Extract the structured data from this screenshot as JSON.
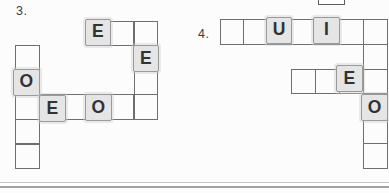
{
  "colors": {
    "bg": "#fcfcfc",
    "grid-line": "#6f6f6f",
    "tile-bg": "#e5e5e5",
    "tile-border": "#9a9a9a",
    "letter": "#323232",
    "label": "#3c3c3c",
    "divider-top": "#c6c6c6",
    "divider-bottom": "#a2a2a2"
  },
  "puzzles": [
    {
      "number": "3.",
      "label_pos": {
        "x": 16,
        "y": 4
      },
      "grid": {
        "x": 15,
        "y": 20.5,
        "cell_w": 23.7,
        "cell_h": 24.6
      },
      "cells": [
        [
          3,
          0
        ],
        [
          4,
          0
        ],
        [
          5,
          0
        ],
        [
          0,
          1
        ],
        [
          5,
          1
        ],
        [
          0,
          2
        ],
        [
          5,
          2
        ],
        [
          0,
          3
        ],
        [
          1,
          3
        ],
        [
          2,
          3
        ],
        [
          3,
          3
        ],
        [
          4,
          3
        ],
        [
          5,
          3
        ],
        [
          0,
          4
        ],
        [
          0,
          5
        ]
      ],
      "tiles": [
        {
          "col": 3,
          "row": 0,
          "letter": "E",
          "dx": -1.5,
          "dy": -2
        },
        {
          "col": 5,
          "row": 1,
          "letter": "E",
          "dx": -1,
          "dy": 0
        },
        {
          "col": 0,
          "row": 2,
          "letter": "O",
          "dx": -2,
          "dy": -1
        },
        {
          "col": 1,
          "row": 3,
          "letter": "E",
          "dx": 0.5,
          "dy": 1
        },
        {
          "col": 3,
          "row": 3,
          "letter": "O",
          "dx": -1,
          "dy": 0
        }
      ]
    },
    {
      "number": "4.",
      "label_pos": {
        "x": 198,
        "y": 27
      },
      "grid": {
        "x": 219.5,
        "y": 19,
        "cell_w": 23.9,
        "cell_h": 24.8
      },
      "cells": [
        [
          0,
          0
        ],
        [
          1,
          0
        ],
        [
          2,
          0
        ],
        [
          3,
          0
        ],
        [
          4,
          0
        ],
        [
          5,
          0
        ],
        [
          6,
          0
        ],
        [
          6,
          1
        ],
        [
          3,
          2
        ],
        [
          4,
          2
        ],
        [
          5,
          2
        ],
        [
          6,
          2
        ],
        [
          6,
          3
        ],
        [
          6,
          4
        ],
        [
          6,
          5
        ]
      ],
      "tiles": [
        {
          "col": 2,
          "row": 0,
          "letter": "U",
          "dx": -1.5,
          "dy": -2.5
        },
        {
          "col": 4,
          "row": 0,
          "letter": "I",
          "dx": -2,
          "dy": -2.5
        },
        {
          "col": 5,
          "row": 2,
          "letter": "E",
          "dx": -3,
          "dy": -3.5
        },
        {
          "col": 6,
          "row": 3,
          "letter": "O",
          "dx": -1.5,
          "dy": 0.5
        }
      ]
    }
  ],
  "tile_size": {
    "w": 26.5,
    "h": 27
  },
  "partial_box_above": {
    "x": 318,
    "y": -9,
    "w": 27,
    "h": 13.5
  },
  "divider": {
    "y": 182,
    "h": 5.5
  }
}
